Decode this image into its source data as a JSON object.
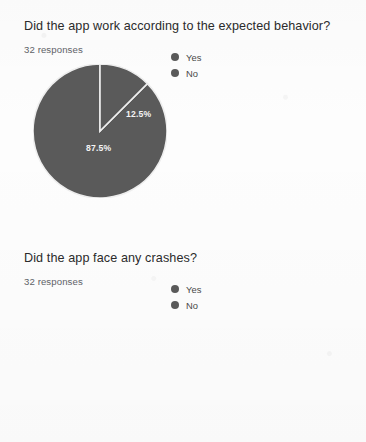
{
  "page": {
    "background_color": "#fdfdfd",
    "slice_color": "#5a5a5a",
    "separator_color": "#eeeeee",
    "label_color": "#f4f4f4"
  },
  "questions": [
    {
      "title": "Did the app work according to the expected behavior?",
      "response_count": "32 responses",
      "legend": [
        {
          "label": "Yes",
          "color": "#5a5a5a",
          "icon": "legend-dot-icon"
        },
        {
          "label": "No",
          "color": "#5a5a5a",
          "icon": "legend-dot-icon"
        }
      ],
      "chart_data": {
        "type": "pie",
        "title": "Did the app work according to the expected behavior?",
        "subtitle": "32 responses",
        "categories": [
          "Yes",
          "No"
        ],
        "values": [
          87.5,
          12.5
        ],
        "value_labels": [
          "87.5%",
          "12.5%"
        ],
        "total_responses": 32,
        "counts": [
          28,
          4
        ],
        "unit": "percent",
        "legend_position": "top-right",
        "start_angle_deg": 0,
        "slices": [
          {
            "name": "Yes",
            "value": 87.5,
            "label": "87.5%",
            "start_deg": 45,
            "end_deg": 360,
            "color": "#5a5a5a",
            "label_x": 53,
            "label_y": 87
          },
          {
            "name": "No",
            "value": 12.5,
            "label": "12.5%",
            "start_deg": 0,
            "end_deg": 45,
            "color": "#5a5a5a",
            "label_x": 93,
            "label_y": 53
          }
        ]
      }
    },
    {
      "title": "Did the app face any crashes?",
      "response_count": "32 responses",
      "legend": [
        {
          "label": "Yes",
          "color": "#5a5a5a",
          "icon": "legend-dot-icon"
        },
        {
          "label": "No",
          "color": "#5a5a5a",
          "icon": "legend-dot-icon"
        }
      ],
      "chart_data": {
        "type": "pie",
        "title": "Did the app face any crashes?",
        "subtitle": "32 responses",
        "categories": [
          "Yes",
          "No"
        ],
        "values": [
          75,
          25
        ],
        "value_labels": [
          "75%",
          "25%"
        ],
        "total_responses": 32,
        "counts": [
          24,
          8
        ],
        "unit": "percent",
        "legend_position": "top-right",
        "start_angle_deg": 90,
        "cropped_at_bottom": true,
        "slices": [
          {
            "name": "Yes",
            "value": 75,
            "label": "75%",
            "start_deg": 180,
            "end_deg": 450,
            "color": "#5a5a5a",
            "label_x": 38,
            "label_y": 24
          },
          {
            "name": "No",
            "value": 25,
            "label": "25%",
            "start_deg": 90,
            "end_deg": 180,
            "color": "#5a5a5a",
            "label_x": 96,
            "label_y": 94
          }
        ]
      }
    }
  ]
}
